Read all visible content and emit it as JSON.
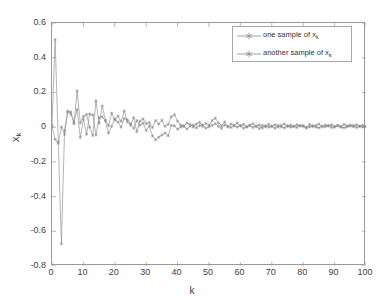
{
  "chart_data": {
    "type": "line",
    "title": "",
    "xlabel": "k",
    "ylabel": "x_k",
    "ylabel_base": "x",
    "ylabel_sub": "k",
    "xlim": [
      0,
      100
    ],
    "ylim": [
      -0.8,
      0.6
    ],
    "xticks": [
      0,
      10,
      20,
      30,
      40,
      50,
      60,
      70,
      80,
      90,
      100
    ],
    "yticks": [
      -0.8,
      -0.6,
      -0.4,
      -0.2,
      0,
      0.2,
      0.4,
      0.6
    ],
    "xtick_labels": [
      "0",
      "10",
      "20",
      "30",
      "40",
      "50",
      "60",
      "70",
      "80",
      "90",
      "100"
    ],
    "ytick_labels": [
      "-0.8",
      "-0.6",
      "-0.4",
      "-0.2",
      "0",
      "0.2",
      "0.4",
      "0.6"
    ],
    "grid": false,
    "legend_position": "upper right",
    "marker": "star",
    "line_color": "#8c8c8c",
    "axis_color": "#9a9a9a",
    "background": "#ffffff",
    "x": [
      0,
      1,
      2,
      3,
      4,
      5,
      6,
      7,
      8,
      9,
      10,
      11,
      12,
      13,
      14,
      15,
      16,
      17,
      18,
      19,
      20,
      21,
      22,
      23,
      24,
      25,
      26,
      27,
      28,
      29,
      30,
      31,
      32,
      33,
      34,
      35,
      36,
      37,
      38,
      39,
      40,
      41,
      42,
      43,
      44,
      45,
      46,
      47,
      48,
      49,
      50,
      51,
      52,
      53,
      54,
      55,
      56,
      57,
      58,
      59,
      60,
      61,
      62,
      63,
      64,
      65,
      66,
      67,
      68,
      69,
      70,
      71,
      72,
      73,
      74,
      75,
      76,
      77,
      78,
      79,
      80,
      81,
      82,
      83,
      84,
      85,
      86,
      87,
      88,
      89,
      90,
      91,
      92,
      93,
      94,
      95,
      96,
      97,
      98,
      99,
      100
    ],
    "series": [
      {
        "name": "one sample of x_k",
        "label_base": "one sample of x",
        "label_sub": "k",
        "color": "#8c8c8c",
        "marker": "star",
        "values": [
          0.01,
          0.505,
          -0.085,
          -0.672,
          -0.02,
          0.09,
          0.088,
          0.02,
          0.208,
          0.025,
          0.062,
          0.073,
          0.0,
          -0.048,
          0.152,
          0.022,
          0.122,
          0.04,
          0.009,
          0.08,
          0.041,
          0.064,
          0.033,
          0.093,
          0.03,
          0.01,
          0.055,
          -0.026,
          0.035,
          0.048,
          0.02,
          0.026,
          -0.002,
          0.038,
          0.018,
          0.04,
          0.004,
          0.016,
          0.06,
          0.072,
          0.034,
          0.012,
          0.008,
          0.024,
          0.016,
          0.0,
          0.018,
          0.028,
          0.004,
          0.022,
          0.012,
          0.038,
          0.052,
          0.024,
          0.008,
          0.03,
          0.002,
          0.018,
          0.01,
          0.024,
          0.006,
          0.016,
          0.0,
          0.012,
          0.02,
          0.004,
          -0.008,
          0.01,
          0.002,
          0.016,
          0.006,
          0.014,
          0.0,
          0.01,
          0.018,
          0.004,
          0.012,
          0.002,
          0.014,
          0.006,
          0.01,
          0.0,
          0.016,
          0.004,
          0.01,
          0.018,
          0.002,
          0.012,
          0.006,
          0.014,
          0.0,
          0.01,
          0.004,
          0.016,
          0.008,
          0.012,
          0.002,
          0.014,
          0.006,
          0.01,
          0.004
        ]
      },
      {
        "name": "another sample of x_k",
        "label_base": "another sample of x",
        "label_sub": "k",
        "color": "#8c8c8c",
        "marker": "star",
        "values": [
          0.002,
          -0.07,
          -0.093,
          0.0,
          -0.041,
          0.09,
          0.076,
          0.026,
          0.102,
          -0.06,
          0.045,
          -0.041,
          0.075,
          0.07,
          -0.045,
          0.055,
          0.06,
          0.036,
          -0.034,
          0.005,
          0.048,
          0.03,
          0.0,
          0.05,
          0.042,
          0.02,
          -0.007,
          0.038,
          0.01,
          0.024,
          -0.02,
          0.006,
          -0.05,
          -0.073,
          -0.058,
          -0.046,
          -0.034,
          -0.05,
          0.01,
          0.008,
          -0.012,
          0.0,
          0.004,
          -0.01,
          0.006,
          0.012,
          -0.004,
          0.008,
          0.014,
          -0.006,
          0.002,
          0.01,
          0.02,
          0.005,
          -0.008,
          0.012,
          0.004,
          -0.002,
          0.008,
          0.0,
          0.01,
          -0.006,
          0.004,
          0.008,
          -0.002,
          0.006,
          0.012,
          -0.004,
          0.008,
          0.0,
          0.004,
          -0.006,
          0.01,
          0.002,
          -0.004,
          0.008,
          0.0,
          0.006,
          -0.002,
          0.01,
          0.004,
          -0.006,
          0.002,
          0.008,
          0.0,
          -0.004,
          0.006,
          0.002,
          0.01,
          -0.002,
          0.004,
          0.008,
          0.0,
          -0.004,
          0.002,
          0.006,
          0.01,
          -0.002,
          0.004,
          0.0,
          0.006
        ]
      }
    ]
  }
}
